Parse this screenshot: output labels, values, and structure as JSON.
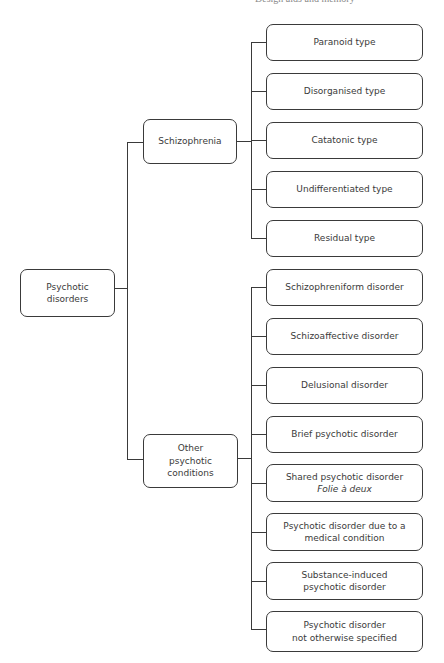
{
  "header": {
    "text": "Design aids and memory"
  },
  "root": {
    "lines": [
      "Psychotic",
      "disorders"
    ]
  },
  "branches": [
    {
      "lines": [
        "Schizophrenia"
      ],
      "children": [
        {
          "lines": [
            "Paranoid type"
          ]
        },
        {
          "lines": [
            "Disorganised type"
          ]
        },
        {
          "lines": [
            "Catatonic type"
          ]
        },
        {
          "lines": [
            "Undifferentiated type"
          ]
        },
        {
          "lines": [
            "Residual type"
          ]
        }
      ]
    },
    {
      "lines": [
        "Other",
        "psychotic",
        "conditions"
      ],
      "children": [
        {
          "lines": [
            "Schizophreniform disorder"
          ]
        },
        {
          "lines": [
            "Schizoaffective disorder"
          ]
        },
        {
          "lines": [
            "Delusional disorder"
          ]
        },
        {
          "lines": [
            "Brief psychotic disorder"
          ]
        },
        {
          "lines": [
            "Shared psychotic disorder"
          ],
          "subtitle": "Folie à deux"
        },
        {
          "lines": [
            "Psychotic disorder due to a",
            "medical condition"
          ]
        },
        {
          "lines": [
            "Substance-induced",
            "psychotic disorder"
          ]
        },
        {
          "lines": [
            "Psychotic disorder",
            "not otherwise specified"
          ]
        }
      ]
    }
  ],
  "colors": {
    "stroke": "#3a3a3a",
    "text": "#3a3a3a",
    "background": "#ffffff"
  }
}
